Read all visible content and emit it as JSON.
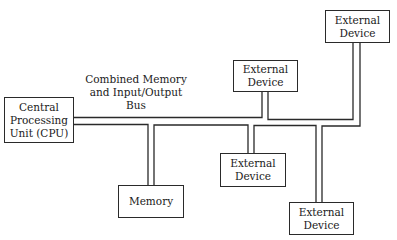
{
  "diagram": {
    "bus_label": "Combined Memory and Input/Output Bus",
    "bus_label_lines": [
      "Combined Memory",
      "and Input/Output",
      "Bus"
    ],
    "nodes": {
      "cpu": {
        "lines": [
          "Central",
          "Processing",
          "Unit (CPU)"
        ]
      },
      "memory": {
        "lines": [
          "Memory"
        ]
      },
      "device_top_right": {
        "lines": [
          "External",
          "Device"
        ]
      },
      "device_upper_middle": {
        "lines": [
          "External",
          "Device"
        ]
      },
      "device_lower_middle": {
        "lines": [
          "External",
          "Device"
        ]
      },
      "device_bottom_right": {
        "lines": [
          "External",
          "Device"
        ]
      }
    },
    "connections": [
      [
        "cpu",
        "bus"
      ],
      [
        "bus",
        "memory"
      ],
      [
        "bus",
        "device_upper_middle"
      ],
      [
        "bus",
        "device_lower_middle"
      ],
      [
        "bus",
        "device_top_right"
      ],
      [
        "bus",
        "device_bottom_right"
      ]
    ],
    "colors": {
      "line": "#2a2a2a",
      "background": "#ffffff"
    }
  }
}
